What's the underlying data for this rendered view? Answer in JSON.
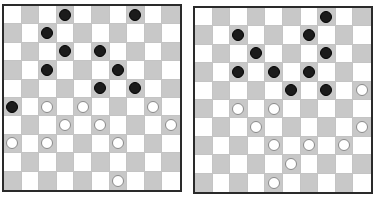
{
  "boards": [
    {
      "id": "board-left",
      "size": 10,
      "colors": {
        "light": "#ffffff",
        "dark": "#c8c8c8",
        "black_piece": "#1b1b1b",
        "white_piece": "#ffffff"
      },
      "black": [
        [
          0,
          3
        ],
        [
          0,
          7
        ],
        [
          1,
          2
        ],
        [
          2,
          3
        ],
        [
          2,
          5
        ],
        [
          3,
          2
        ],
        [
          3,
          6
        ],
        [
          4,
          5
        ],
        [
          4,
          7
        ],
        [
          5,
          0
        ]
      ],
      "white": [
        [
          5,
          2
        ],
        [
          5,
          4
        ],
        [
          5,
          8
        ],
        [
          6,
          3
        ],
        [
          6,
          5
        ],
        [
          6,
          9
        ],
        [
          7,
          0
        ],
        [
          7,
          2
        ],
        [
          7,
          6
        ],
        [
          9,
          6
        ]
      ]
    },
    {
      "id": "board-right",
      "size": 10,
      "colors": {
        "light": "#ffffff",
        "dark": "#c8c8c8",
        "black_piece": "#1b1b1b",
        "white_piece": "#ffffff"
      },
      "black": [
        [
          0,
          7
        ],
        [
          1,
          2
        ],
        [
          1,
          6
        ],
        [
          2,
          3
        ],
        [
          2,
          7
        ],
        [
          3,
          2
        ],
        [
          3,
          4
        ],
        [
          3,
          6
        ],
        [
          4,
          5
        ],
        [
          4,
          7
        ]
      ],
      "white": [
        [
          4,
          9
        ],
        [
          5,
          2
        ],
        [
          5,
          4
        ],
        [
          6,
          3
        ],
        [
          6,
          9
        ],
        [
          7,
          4
        ],
        [
          7,
          6
        ],
        [
          7,
          8
        ],
        [
          8,
          5
        ],
        [
          9,
          4
        ]
      ]
    }
  ]
}
